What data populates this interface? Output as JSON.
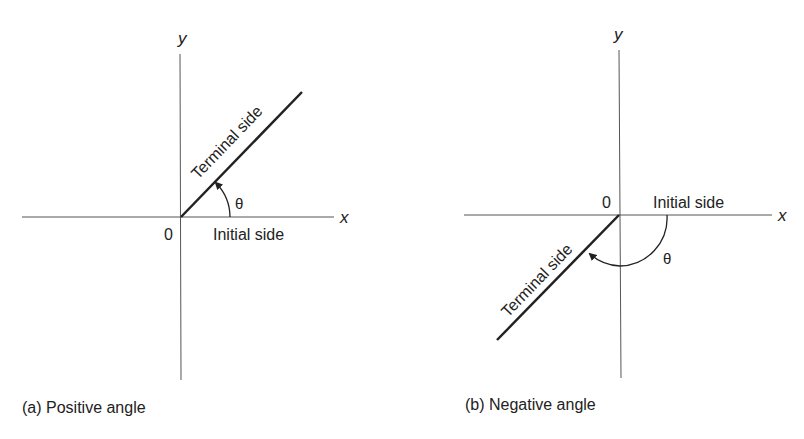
{
  "panels": [
    {
      "id": "a",
      "caption": "(a) Positive angle",
      "axis_x_label": "x",
      "axis_y_label": "y",
      "origin_label": "0",
      "terminal_label": "Terminal side",
      "initial_label": "Initial side",
      "angle_label": "θ"
    },
    {
      "id": "b",
      "caption": "(b) Negative angle",
      "axis_x_label": "x",
      "axis_y_label": "y",
      "origin_label": "0",
      "terminal_label": "Terminal side",
      "initial_label": "Initial side",
      "angle_label": "θ"
    }
  ],
  "colors": {
    "line": "#222222",
    "axis": "#555555",
    "background": "#ffffff"
  }
}
